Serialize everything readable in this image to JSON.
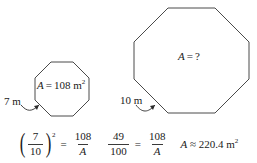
{
  "figure": {
    "stroke_color": "#4a4a4a",
    "text_color": "#1a1a1a"
  },
  "small_shape": {
    "name": "small-octagon",
    "area_var": "A",
    "area_equals": "=",
    "area_value": "108 m",
    "area_unit_exponent": "2",
    "side_label": "7 m"
  },
  "large_shape": {
    "name": "large-octagon",
    "area_var": "A",
    "area_equals": "=",
    "area_value": "?",
    "side_label": "10 m"
  },
  "equation": {
    "step1": {
      "paren_open": "(",
      "paren_close": ")",
      "numerator": "7",
      "denominator": "10",
      "exponent": "2",
      "relation": "=",
      "rhs_numerator": "108",
      "rhs_denominator": "A"
    },
    "step2": {
      "numerator": "49",
      "denominator": "100",
      "relation": "=",
      "rhs_numerator": "108",
      "rhs_denominator": "A"
    },
    "result": {
      "var": "A",
      "approx_symbol": "≈",
      "value": "220.4 m",
      "unit_exponent": "2"
    }
  }
}
